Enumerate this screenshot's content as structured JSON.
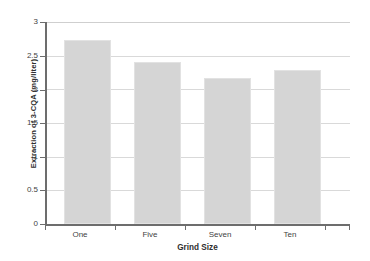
{
  "chart_data": {
    "type": "bar",
    "title": "",
    "xlabel": "Grind Size",
    "ylabel": "Extraction of 3-CQA (mg/liter)",
    "categories": [
      "One",
      "Five",
      "Seven",
      "Ten"
    ],
    "values": [
      2.73,
      2.41,
      2.17,
      2.29
    ],
    "ylim": [
      0,
      3
    ],
    "ytick_labels": [
      "0",
      "0.5",
      "1",
      "1.5",
      "2",
      "2.5",
      "3"
    ],
    "ytick_values": [
      0,
      0.5,
      1,
      1.5,
      2,
      2.5,
      3
    ],
    "grid": "horizontal",
    "legend": "none",
    "bar_color": "#d5d5d5",
    "bar_edge_color": "#e2e2e2",
    "axis_color": "#6d6d6d",
    "gridline_color": "#d9d9d9",
    "background_color": "#ffffff"
  }
}
